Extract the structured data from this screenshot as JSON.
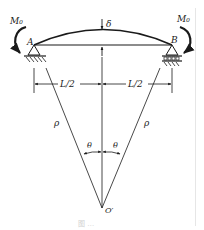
{
  "figure": {
    "type": "beam-bending-diagram",
    "labels": {
      "moment_left": "M₀",
      "moment_right": "M₀",
      "support_left": "A",
      "support_right": "B",
      "deflection": "δ",
      "half_span_left": "L/2",
      "half_span_right": "L/2",
      "radius_left": "ρ",
      "radius_right": "ρ",
      "angle_left": "θ",
      "angle_right": "θ",
      "center": "O′"
    },
    "caption": "图 …",
    "colors": {
      "stroke": "#1a1a1a",
      "caption": "#d0d0d0",
      "background": "#ffffff"
    }
  }
}
